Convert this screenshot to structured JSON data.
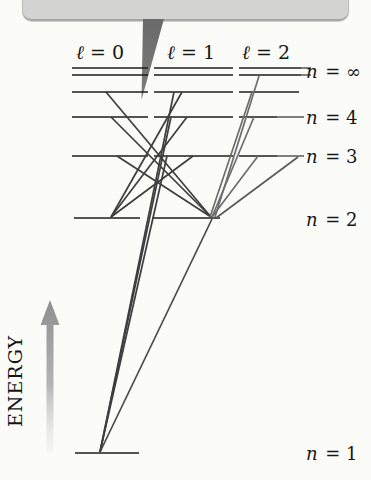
{
  "figure": {
    "background": "#fbfbf8",
    "callout": {
      "text": "",
      "fill": "#d3d3d2",
      "border": "#a6a6a4",
      "pointer_color": "#6f6f6f"
    },
    "energy_axis": {
      "label": "ENERGY",
      "arrow_color_top": "#8f8f8f",
      "arrow_color_bottom": "#e6e6e4"
    },
    "column_headers": [
      {
        "var": "ℓ",
        "rest": "= 0",
        "cx": 100
      },
      {
        "var": "ℓ",
        "rest": "= 1",
        "cx": 191
      },
      {
        "var": "ℓ",
        "rest": "= 2",
        "cx": 266
      }
    ],
    "level_labels": [
      {
        "var": "n",
        "rest": "= ∞",
        "y": 71
      },
      {
        "var": "n",
        "rest": "= 4",
        "y": 117
      },
      {
        "var": "n",
        "rest": "= 3",
        "y": 156
      },
      {
        "var": "n",
        "rest": "= 2",
        "y": 219
      },
      {
        "var": "n",
        "rest": "= 1",
        "y": 453
      }
    ],
    "levels": [
      {
        "name": "n-infinity-upper",
        "y": 68,
        "segments": [
          [
            72,
            148
          ],
          [
            154,
            233
          ],
          [
            239,
            301
          ]
        ],
        "leader": [
          301,
          311
        ]
      },
      {
        "name": "n-infinity-lower",
        "y": 75,
        "segments": [
          [
            72,
            148
          ],
          [
            154,
            233
          ],
          [
            239,
            301
          ]
        ],
        "leader": [
          301,
          311
        ]
      },
      {
        "name": "n-5",
        "y": 92,
        "segments": [
          [
            72,
            148
          ],
          [
            154,
            233
          ],
          [
            239,
            299
          ]
        ]
      },
      {
        "name": "n-4",
        "y": 117,
        "segments": [
          [
            72,
            148
          ],
          [
            154,
            233
          ],
          [
            239,
            277
          ]
        ],
        "leader": [
          277,
          304
        ]
      },
      {
        "name": "n-3",
        "y": 156,
        "segments": [
          [
            72,
            148
          ],
          [
            154,
            233
          ],
          [
            239,
            277
          ]
        ],
        "leader": [
          277,
          304
        ]
      },
      {
        "name": "n-2",
        "y": 218,
        "segments": [
          [
            74,
            140
          ],
          [
            152,
            220
          ]
        ]
      },
      {
        "name": "n-1",
        "y": 453,
        "segments": [
          [
            75,
            139
          ]
        ]
      }
    ],
    "level_color": "#1c1c1c",
    "transitions": [
      {
        "name": "2p-1s",
        "x1": 212,
        "y1": 219,
        "x2": 100,
        "y2": 452,
        "color": "#4a4a4a"
      },
      {
        "name": "3p-1s",
        "x1": 167,
        "y1": 156,
        "x2": 100,
        "y2": 452,
        "color": "#3e3e3e"
      },
      {
        "name": "4p-1s",
        "x1": 171,
        "y1": 117,
        "x2": 100,
        "y2": 452,
        "color": "#3e3e3e"
      },
      {
        "name": "5p-1s",
        "x1": 174,
        "y1": 92,
        "x2": 100,
        "y2": 452,
        "color": "#3e3e3e"
      },
      {
        "name": "3p-2s",
        "x1": 193,
        "y1": 156,
        "x2": 111,
        "y2": 217,
        "color": "#3e3e3e"
      },
      {
        "name": "4p-2s",
        "x1": 187,
        "y1": 117,
        "x2": 111,
        "y2": 217,
        "color": "#3e3e3e"
      },
      {
        "name": "5p-2s",
        "x1": 182,
        "y1": 92,
        "x2": 111,
        "y2": 217,
        "color": "#3e3e3e"
      },
      {
        "name": "3s-2p",
        "x1": 117,
        "y1": 156,
        "x2": 211,
        "y2": 217,
        "color": "#3e3e3e"
      },
      {
        "name": "4s-2p",
        "x1": 111,
        "y1": 117,
        "x2": 211,
        "y2": 217,
        "color": "#3e3e3e"
      },
      {
        "name": "5s-2p",
        "x1": 106,
        "y1": 92,
        "x2": 211,
        "y2": 217,
        "color": "#3e3e3e"
      },
      {
        "name": "3d-2p",
        "x1": 258,
        "y1": 156,
        "x2": 212,
        "y2": 217,
        "color": "#6d6d6d"
      },
      {
        "name": "3d-2p-right",
        "x1": 298,
        "y1": 157,
        "x2": 216,
        "y2": 218,
        "color": "#5a5a5a"
      },
      {
        "name": "4d-2p",
        "x1": 254,
        "y1": 117,
        "x2": 212,
        "y2": 217,
        "color": "#6d6d6d"
      },
      {
        "name": "5d-2p",
        "x1": 252,
        "y1": 92,
        "x2": 210,
        "y2": 217,
        "color": "#6d6d6d"
      },
      {
        "name": "inf-d-2p",
        "x1": 259,
        "y1": 76,
        "x2": 215,
        "y2": 217,
        "color": "#6d6d6d"
      }
    ]
  }
}
